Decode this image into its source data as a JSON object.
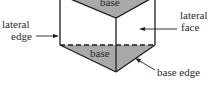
{
  "diagram": {
    "title": "",
    "labels": {
      "top_base": "base",
      "bottom_base": "base",
      "lateral_edge_line1": "lateral",
      "lateral_edge_line2": "edge",
      "lateral_face_line1": "lateral",
      "lateral_face_line2": "face",
      "base_edge": "base edge"
    },
    "colors": {
      "base_fill": "#a9a9a9",
      "stroke": "#1e1e1e",
      "text": "#2a2a2a"
    }
  }
}
